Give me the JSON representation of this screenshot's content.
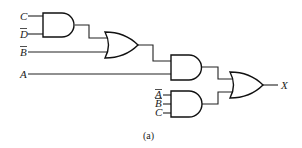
{
  "diagram": {
    "type": "logic-circuit",
    "caption": "(a)",
    "inputs": [
      {
        "id": "in_c1",
        "label": "C",
        "negated": false
      },
      {
        "id": "in_d",
        "label": "D",
        "negated": true
      },
      {
        "id": "in_b1",
        "label": "B",
        "negated": true
      },
      {
        "id": "in_a1",
        "label": "A",
        "negated": false
      },
      {
        "id": "in_a2",
        "label": "A",
        "negated": true
      },
      {
        "id": "in_b2",
        "label": "B",
        "negated": true
      },
      {
        "id": "in_c2",
        "label": "C",
        "negated": false
      }
    ],
    "output": {
      "label": "X"
    },
    "gates": [
      {
        "id": "and1",
        "type": "AND",
        "inputs": [
          "C",
          "D̄"
        ]
      },
      {
        "id": "or1",
        "type": "OR",
        "inputs": [
          "and1",
          "B̄"
        ]
      },
      {
        "id": "and2",
        "type": "AND",
        "inputs": [
          "or1",
          "A"
        ]
      },
      {
        "id": "and3",
        "type": "AND",
        "inputs": [
          "Ā",
          "B̄",
          "C"
        ]
      },
      {
        "id": "or2",
        "type": "OR",
        "inputs": [
          "and2",
          "and3"
        ],
        "output": "X"
      }
    ]
  }
}
